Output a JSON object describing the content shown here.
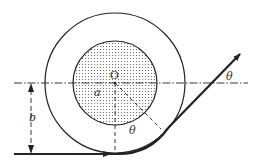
{
  "diagram": {
    "title": "",
    "colors": {
      "stroke": "#222222",
      "dots": "#555555",
      "background": "#ffffff"
    },
    "labels": {
      "center": "O",
      "inner_radius": "a",
      "impact_parameter": "b",
      "angle_inner": "θ",
      "angle_outer": "θ"
    },
    "geometry": {
      "center": [
        115,
        83
      ],
      "outer_radius": 70,
      "inner_radius": 42,
      "axis_y": 83,
      "incoming_path_y": 154
    }
  }
}
